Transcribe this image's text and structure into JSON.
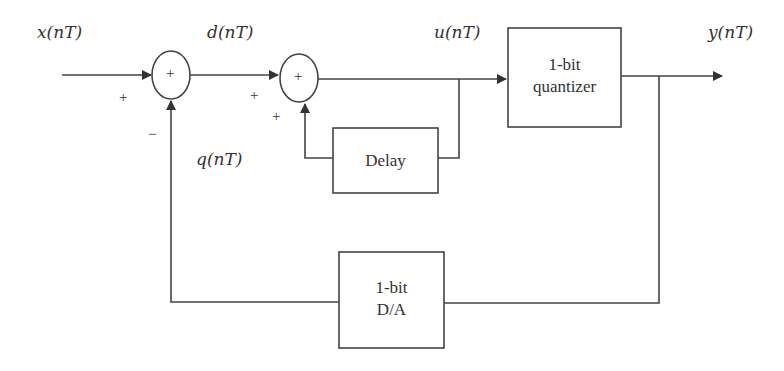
{
  "diagram": {
    "type": "block-diagram",
    "signals": {
      "input": "x(nT)",
      "difference": "d(nT)",
      "integrator_output": "u(nT)",
      "output": "y(nT)",
      "feedback": "q(nT)"
    },
    "blocks": {
      "summer1": {
        "symbol": "+",
        "input_signs": [
          "+",
          "−"
        ]
      },
      "summer2": {
        "symbol": "+",
        "input_signs": [
          "+",
          "+"
        ]
      },
      "delay": {
        "label": "Delay"
      },
      "quantizer": {
        "line1": "1-bit",
        "line2": "quantizer"
      },
      "dac": {
        "line1": "1-bit",
        "line2": "D/A"
      }
    },
    "colors": {
      "stroke": "#333333",
      "background": "#ffffff"
    }
  }
}
